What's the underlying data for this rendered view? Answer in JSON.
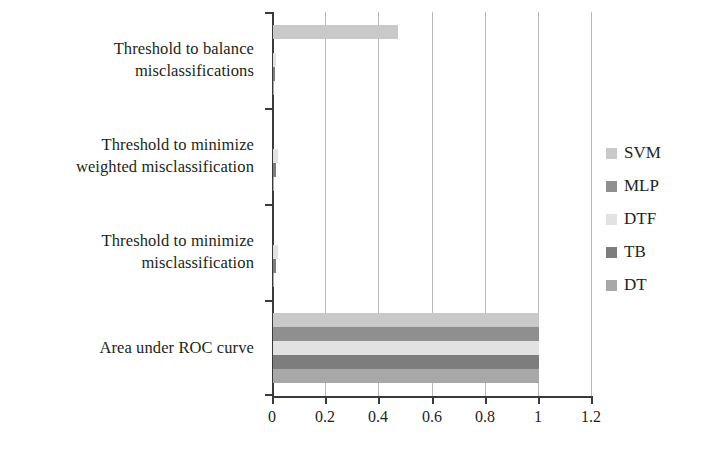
{
  "chart_data": {
    "type": "bar",
    "orientation": "horizontal",
    "title": "",
    "xlabel": "",
    "ylabel": "",
    "xlim": [
      0,
      1.2
    ],
    "xticks": [
      "0",
      "0.2",
      "0.4",
      "0.6",
      "0.8",
      "1",
      "1.2"
    ],
    "xtick_values": [
      0,
      0.2,
      0.4,
      0.6,
      0.8,
      1,
      1.2
    ],
    "grid": "vertical",
    "legend_position": "right",
    "categories": [
      "Threshold to balance misclassifications",
      "Threshold to minimize weighted misclassification",
      "Threshold to minimize misclassification",
      "Area under ROC curve"
    ],
    "category_lines": [
      [
        "Threshold to balance",
        "misclassifications"
      ],
      [
        "Threshold to minimize",
        "weighted misclassification"
      ],
      [
        "Threshold to minimize",
        "misclassification"
      ],
      [
        "Area under ROC curve"
      ]
    ],
    "series": [
      {
        "name": "SVM",
        "color": "#c9c9c9",
        "values": [
          0.47,
          0.0,
          0.0,
          1.0
        ]
      },
      {
        "name": "MLP",
        "color": "#8f8f8f",
        "values": [
          0.0,
          0.0,
          0.0,
          1.0
        ]
      },
      {
        "name": "DTF",
        "color": "#e2e2e2",
        "values": [
          0.012,
          0.018,
          0.018,
          1.0
        ]
      },
      {
        "name": "TB",
        "color": "#7d7d7d",
        "values": [
          0.008,
          0.012,
          0.012,
          1.0
        ]
      },
      {
        "name": "DT",
        "color": "#a8a8a8",
        "values": [
          0.004,
          0.004,
          0.004,
          1.0
        ]
      }
    ]
  },
  "legend": {
    "items": [
      {
        "label": "SVM",
        "color": "#c9c9c9"
      },
      {
        "label": "MLP",
        "color": "#8f8f8f"
      },
      {
        "label": "DTF",
        "color": "#e2e2e2"
      },
      {
        "label": "TB",
        "color": "#7d7d7d"
      },
      {
        "label": "DT",
        "color": "#a8a8a8"
      }
    ]
  },
  "axis": {
    "grid_color": "#b9b9b9",
    "axis_color": "#3a3a3a",
    "text_color": "#231f20"
  }
}
